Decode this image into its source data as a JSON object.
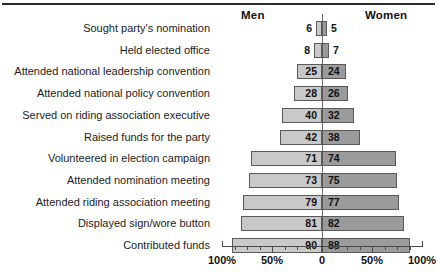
{
  "header": {
    "men_label": "Men",
    "women_label": "Women"
  },
  "axis": {
    "ticks": [
      "100%",
      "50%",
      "0",
      "50%",
      "100%"
    ],
    "tick_values": [
      -100,
      -50,
      0,
      50,
      100
    ],
    "t0": "100%",
    "t1": "50%",
    "t2": "0",
    "t3": "50%",
    "t4": "100%"
  },
  "rows": [
    {
      "label": "Sought party's nomination",
      "men": 6,
      "women": 5,
      "men_text": "6",
      "women_text": "5"
    },
    {
      "label": "Held elected office",
      "men": 8,
      "women": 7,
      "men_text": "8",
      "women_text": "7"
    },
    {
      "label": "Attended national leadership convention",
      "men": 25,
      "women": 24,
      "men_text": "25",
      "women_text": "24"
    },
    {
      "label": "Attended national policy convention",
      "men": 28,
      "women": 26,
      "men_text": "28",
      "women_text": "26"
    },
    {
      "label": "Served on riding association executive",
      "men": 40,
      "women": 32,
      "men_text": "40",
      "women_text": "32"
    },
    {
      "label": "Raised funds for the party",
      "men": 42,
      "women": 38,
      "men_text": "42",
      "women_text": "38"
    },
    {
      "label": "Volunteered in election campaign",
      "men": 71,
      "women": 74,
      "men_text": "71",
      "women_text": "74"
    },
    {
      "label": "Attended nomination meeting",
      "men": 73,
      "women": 75,
      "men_text": "73",
      "women_text": "75"
    },
    {
      "label": "Attended riding association meeting",
      "men": 79,
      "women": 77,
      "men_text": "79",
      "women_text": "77"
    },
    {
      "label": "Displayed sign/wore button",
      "men": 81,
      "women": 82,
      "men_text": "81",
      "women_text": "82"
    },
    {
      "label": "Contributed funds",
      "men": 90,
      "women": 88,
      "men_text": "90",
      "women_text": "88"
    }
  ],
  "colors": {
    "men_bar": "#c9c9c9",
    "women_bar": "#9b9b9b",
    "bar_border": "#5a5a5a",
    "axis": "#4a4a4a",
    "rule": "#2b2b2b",
    "text": "#111111"
  },
  "chart_data": {
    "type": "bar",
    "title": "",
    "subtitle": "",
    "orientation": "horizontal-diverging",
    "xlabel": "",
    "ylabel": "",
    "xlim": [
      -100,
      100
    ],
    "grid": false,
    "legend_position": "top",
    "categories": [
      "Sought party's nomination",
      "Held elected office",
      "Attended national leadership convention",
      "Attended national policy convention",
      "Served on riding association executive",
      "Raised funds for the party",
      "Volunteered in election campaign",
      "Attended nomination meeting",
      "Attended riding association meeting",
      "Displayed sign/wore button",
      "Contributed funds"
    ],
    "series": [
      {
        "name": "Men",
        "direction": "left",
        "values": [
          6,
          8,
          25,
          28,
          40,
          42,
          71,
          73,
          79,
          81,
          90
        ]
      },
      {
        "name": "Women",
        "direction": "right",
        "values": [
          5,
          7,
          24,
          26,
          32,
          38,
          74,
          75,
          77,
          82,
          88
        ]
      }
    ],
    "tick_labels": [
      "100%",
      "50%",
      "0",
      "50%",
      "100%"
    ],
    "units": "percent"
  }
}
